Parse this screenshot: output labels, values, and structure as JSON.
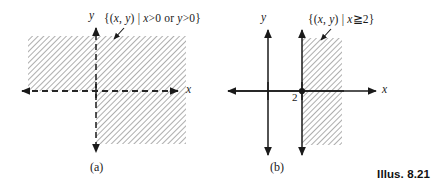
{
  "figure": {
    "caption": "Illus. 8.21",
    "background_color": "#ffffff",
    "ink_color": "#1a1a1a",
    "hatch_color": "#9a9a9a"
  },
  "panels": [
    {
      "id": "a",
      "sub_caption": "(a)",
      "set_label": "{(x, y) | x>0 or y>0}",
      "set_label_parts": {
        "open": "{(",
        "x": "x",
        "comma": ", ",
        "y": "y",
        "close_pair": ") | ",
        "cond1_var": "x",
        "cond1_rel": ">0",
        "connector": " or ",
        "cond2_var": "y",
        "cond2_rel": ">0",
        "close": "}"
      },
      "x_axis_label": "x",
      "y_axis_label": "y",
      "axis_style": "dashed",
      "region_description": "all quadrants except the third (x>0 or y>0)",
      "tick_labels": []
    },
    {
      "id": "b",
      "sub_caption": "(b)",
      "set_label": "{(x, y) | x≧2}",
      "set_label_parts": {
        "open": "{(",
        "x": "x",
        "comma": ", ",
        "y": "y",
        "close_pair": ") | ",
        "cond1_var": "x",
        "cond1_rel": "≧2",
        "close": "}"
      },
      "x_axis_label": "x",
      "y_axis_label": "y",
      "axis_style": "solid",
      "region_description": "half plane to the right of the vertical line x = 2, boundary included",
      "tick_labels": [
        {
          "value": "2",
          "axis": "x"
        }
      ]
    }
  ]
}
